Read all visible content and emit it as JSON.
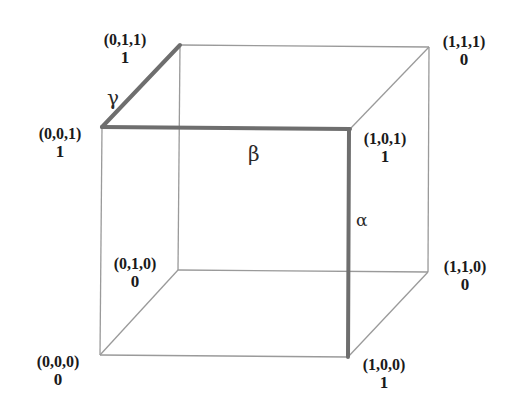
{
  "diagram": {
    "type": "boolean-cube",
    "vertices": [
      {
        "id": "v000",
        "coord": "(0,0,0)",
        "value": "0"
      },
      {
        "id": "v001",
        "coord": "(0,0,1)",
        "value": "1"
      },
      {
        "id": "v010",
        "coord": "(0,1,0)",
        "value": "0"
      },
      {
        "id": "v011",
        "coord": "(0,1,1)",
        "value": "1"
      },
      {
        "id": "v100",
        "coord": "(1,0,0)",
        "value": "1"
      },
      {
        "id": "v101",
        "coord": "(1,0,1)",
        "value": "1"
      },
      {
        "id": "v110",
        "coord": "(1,1,0)",
        "value": "0"
      },
      {
        "id": "v111",
        "coord": "(1,1,1)",
        "value": "0"
      }
    ],
    "highlighted_edges": [
      {
        "label": "γ",
        "from": "(0,0,1)",
        "to": "(0,1,1)"
      },
      {
        "label": "β",
        "from": "(0,0,1)",
        "to": "(1,0,1)"
      },
      {
        "label": "α",
        "from": "(1,0,1)",
        "to": "(1,0,0)"
      }
    ],
    "colors": {
      "edge": "#9a9a9a",
      "highlight": "#6e6e6e",
      "text": "#1a1a1a"
    }
  }
}
